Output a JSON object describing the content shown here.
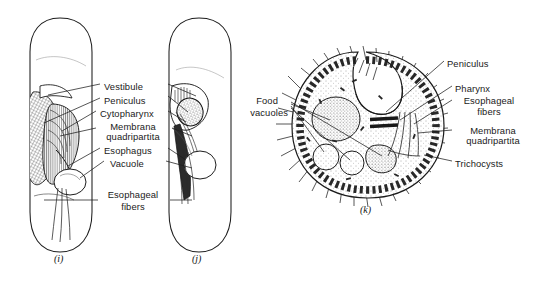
{
  "figure": {
    "domain": "scientific-illustration",
    "background_color": "#ffffff",
    "ink_color": "#1a1a1a",
    "panels": [
      {
        "id": "i",
        "caption": "(i)",
        "description": "elongated whole-cell lateral view with oral apparatus"
      },
      {
        "id": "j",
        "caption": "(j)",
        "description": "elongated whole-cell view rotated, oral apparatus and esophageal fibers"
      },
      {
        "id": "k",
        "caption": "(k)",
        "description": "cross section of ciliated cell showing food vacuoles and cytopharynx"
      }
    ]
  },
  "labels_center": [
    {
      "name": "vestibule",
      "text": "Vestibule",
      "x": 104,
      "y": 81,
      "align": "left"
    },
    {
      "name": "peniculus",
      "text": "Peniculus",
      "x": 104,
      "y": 95,
      "align": "left"
    },
    {
      "name": "cytopharynx",
      "text": "Cytopharynx",
      "x": 100,
      "y": 108,
      "align": "left"
    },
    {
      "name": "membrana",
      "text": "Membrana",
      "x": 133,
      "y": 121,
      "align": "center"
    },
    {
      "name": "quadripartita",
      "text": "quadripartita",
      "x": 133,
      "y": 131,
      "align": "center"
    },
    {
      "name": "esophagus",
      "text": "Esophagus",
      "x": 104,
      "y": 145,
      "align": "left"
    },
    {
      "name": "vacuole",
      "text": "Vacuole",
      "x": 110,
      "y": 158,
      "align": "left"
    },
    {
      "name": "esophageal-fibers-1",
      "text": "Esophageal",
      "x": 133,
      "y": 189,
      "align": "center"
    },
    {
      "name": "esophageal-fibers-2",
      "text": "fibers",
      "x": 133,
      "y": 201,
      "align": "center"
    }
  ],
  "labels_right": [
    {
      "name": "peniculus",
      "text": "Peniculus",
      "x": 447,
      "y": 58,
      "align": "left"
    },
    {
      "name": "pharynx",
      "text": "Pharynx",
      "x": 455,
      "y": 83,
      "align": "left"
    },
    {
      "name": "esophageal-1",
      "text": "Esophageal",
      "x": 489,
      "y": 95,
      "align": "center"
    },
    {
      "name": "esophageal-2",
      "text": "fibers",
      "x": 489,
      "y": 106,
      "align": "center"
    },
    {
      "name": "membrana",
      "text": "Membrana",
      "x": 495,
      "y": 125,
      "align": "center"
    },
    {
      "name": "quadripartita",
      "text": "quadripartita",
      "x": 495,
      "y": 135,
      "align": "center"
    },
    {
      "name": "trichocysts",
      "text": "Trichocysts",
      "x": 455,
      "y": 158,
      "align": "left"
    }
  ],
  "labels_left_k": [
    {
      "name": "food",
      "text": "Food",
      "x": 278,
      "y": 95,
      "align": "right"
    },
    {
      "name": "vacuoles",
      "text": "vacuoles",
      "x": 288,
      "y": 107,
      "align": "right"
    }
  ],
  "captions": [
    {
      "name": "caption-i",
      "text": "(i)",
      "x": 62,
      "y": 258
    },
    {
      "name": "caption-j",
      "text": "(j)",
      "x": 199,
      "y": 258
    },
    {
      "name": "caption-k",
      "text": "(k)",
      "x": 366,
      "y": 209
    }
  ]
}
